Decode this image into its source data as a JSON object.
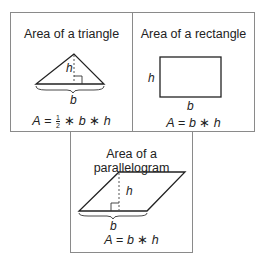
{
  "panels": {
    "triangle": {
      "title": "Area of a triangle",
      "height_label": "h",
      "base_label": "b",
      "formula": {
        "lhs": "A",
        "eq": "=",
        "fraction_num": "1",
        "fraction_den": "2",
        "op1": "∗",
        "var1": "b",
        "op2": "∗",
        "var2": "h"
      }
    },
    "rectangle": {
      "title": "Area of a rectangle",
      "height_label": "h",
      "base_label": "b",
      "formula": {
        "lhs": "A",
        "eq": "=",
        "var1": "b",
        "op1": "∗",
        "var2": "h"
      }
    },
    "parallelogram": {
      "title": "Area of a parallelogram",
      "height_label": "h",
      "base_label": "b",
      "formula": {
        "lhs": "A",
        "eq": "=",
        "var1": "b",
        "op1": "∗",
        "var2": "h"
      }
    }
  },
  "colors": {
    "stroke": "#222222",
    "border": "#8a8a8a",
    "dashed": "#555555"
  }
}
